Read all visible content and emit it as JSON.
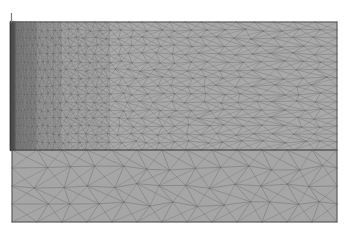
{
  "figure": {
    "title": "Two-zone graded triangular finite-element mesh",
    "background_color": "#ffffff"
  },
  "canvas": {
    "width": 350,
    "height": 239
  },
  "domain": {
    "x_left": 12,
    "x_right": 337,
    "y_top": 22,
    "y_bottom": 222,
    "outline_color": "#5a5a5a",
    "outline_width": 1
  },
  "zones": [
    {
      "id": "upper-zone",
      "name": "Upper graded zone",
      "y_top": 22,
      "y_bottom": 150,
      "fill_color": "#a9a9a9",
      "edge_color": "#6e6e6e",
      "edge_width": 0.55,
      "mesh_type": "graded-triangular",
      "refinement": "fine-at-left-wall",
      "columns": 34,
      "rows": 16,
      "grading_exponent": 2.35,
      "left_subdivision_levels": 3
    },
    {
      "id": "lower-zone",
      "name": "Lower uniform zone",
      "y_top": 150,
      "y_bottom": 222,
      "fill_color": "#a6a6a6",
      "edge_color": "#6b6b6b",
      "edge_width": 0.6,
      "mesh_type": "uniform-triangular",
      "columns": 13,
      "rows": 4
    }
  ],
  "interface": {
    "name": "zone-interface-line",
    "y": 150,
    "x_start": 12,
    "x_end": 337,
    "color": "#4a4a4a",
    "width": 1.1
  },
  "boundary_layer": {
    "name": "left-wall-boundary-layer",
    "x_start": 11,
    "x_end": 15,
    "y_top": 22,
    "y_bottom": 150,
    "color": "#3a3a3a",
    "width": 2.4,
    "layers": 7
  },
  "probe": {
    "name": "top-left-probe-line",
    "x": 11.5,
    "y_start": 13,
    "y_end": 23,
    "color": "#787878",
    "width": 1.2
  },
  "colors": {
    "mesh_fill_upper": "#a9a9a9",
    "mesh_fill_lower": "#a6a6a6",
    "mesh_edge": "#6e6e6e",
    "outline": "#5a5a5a",
    "interface": "#4a4a4a",
    "boundary_layer": "#3a3a3a",
    "background": "#ffffff"
  }
}
